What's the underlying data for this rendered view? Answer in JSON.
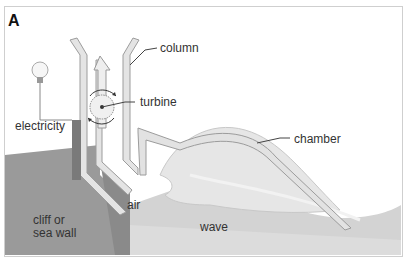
{
  "panel": {
    "letter": "A"
  },
  "labels": {
    "column": "column",
    "turbine": "turbine",
    "electricity": "electricity",
    "chamber": "chamber",
    "air": "air",
    "wave": "wave",
    "cliff_line1": "cliff or",
    "cliff_line2": "sea wall"
  },
  "colors": {
    "cliff": "#9a9a9a",
    "sea": "#d6d6d6",
    "wall": "#c4c4c4",
    "structure_fill": "#e4e4e4",
    "structure_stroke": "#9c9c9c",
    "generator": "#7a7a7a"
  }
}
